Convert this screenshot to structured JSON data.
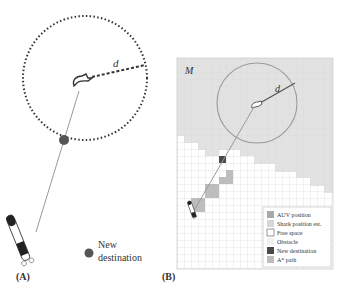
{
  "panel_a": {
    "label": "(A)",
    "distance_label": "d",
    "new_destination_label_line1": "New",
    "new_destination_label_line2": "destination"
  },
  "panel_b": {
    "label": "(B)",
    "map_label": "M",
    "distance_label": "d",
    "legend": [
      {
        "label": "AUV position",
        "color": "#a9a9a9"
      },
      {
        "label": "Shark position est.",
        "color": "#d6d6d6"
      },
      {
        "label": "Free space",
        "color": "#ffffff"
      },
      {
        "label": "Obstacle",
        "color": "#f0f0f0"
      },
      {
        "label": "New destination",
        "color": "#4a4a4a"
      },
      {
        "label": "A* path",
        "color": "#bdbdbd"
      }
    ]
  },
  "colors": {
    "dotted_circle": "#333333",
    "path_line": "#9a9a9a",
    "destination_dot": "#555555",
    "grid_line": "#dcdcdc",
    "shark_region": "#e4e4e4",
    "circle_b": "#9a9a9a"
  }
}
